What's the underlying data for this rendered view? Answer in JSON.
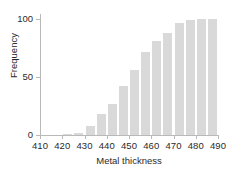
{
  "chart_data": {
    "type": "bar",
    "title": "",
    "subtitle": "",
    "xlabel": "Metal thickness",
    "ylabel": "Frequency",
    "xlim": [
      410,
      490
    ],
    "ylim": [
      0,
      104
    ],
    "grid": false,
    "legend": null,
    "bar_color": "#d9d9d9",
    "axis_color": "#b9b9b9",
    "text_color": "#2b2b2b",
    "bin_width": 5,
    "xticks": [
      410,
      420,
      430,
      440,
      450,
      460,
      470,
      480,
      490
    ],
    "xtick_labels": [
      "410",
      "420",
      "430",
      "440",
      "450",
      "460",
      "470",
      "480",
      "490"
    ],
    "yticks": [
      0,
      50,
      100
    ],
    "ytick_labels": [
      "0",
      "50",
      "100"
    ],
    "categories": [
      "410-415",
      "415-420",
      "420-425",
      "425-430",
      "430-435",
      "435-440",
      "440-445",
      "445-450",
      "450-455",
      "455-460",
      "460-465",
      "465-470",
      "470-475",
      "475-480",
      "480-485",
      "485-490"
    ],
    "bin_starts": [
      410,
      415,
      420,
      425,
      430,
      435,
      440,
      445,
      450,
      455,
      460,
      465,
      470,
      475,
      480,
      485
    ],
    "values": [
      0,
      0,
      1,
      2,
      8,
      18,
      27,
      42,
      56,
      71,
      81,
      88,
      96,
      99,
      100,
      100
    ]
  }
}
